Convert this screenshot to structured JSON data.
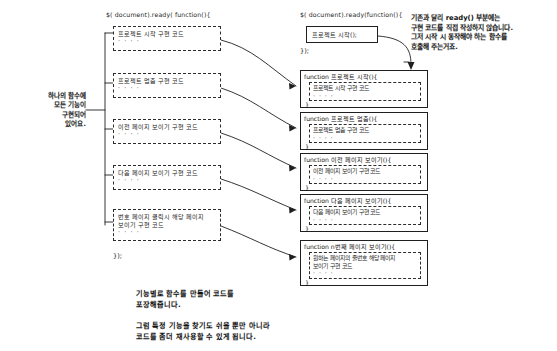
{
  "document": {
    "title": "jQuery ready() 함수 리팩토링 설명 다이어그램",
    "background_color": "#ffffff",
    "ink_color": "#1a1a1a"
  },
  "left_column": {
    "header": "$( document).ready( function(){",
    "footer": "});",
    "blocks": [
      {
        "line1": "프로젝트 시작 구현 코드",
        "line2": "",
        "dots": "· · · ·"
      },
      {
        "line1": "프로젝트 멈춤 구현 코드",
        "line2": "",
        "dots": "· · · ·"
      },
      {
        "line1": "이전 페이지 보이기 구현 코드",
        "line2": "",
        "dots": "· · · ·"
      },
      {
        "line1": "다음 페이지 보이기 구현 코드",
        "line2": "",
        "dots": "· · · ·"
      },
      {
        "line1": "번호 페이지 클릭시 해당 페이지",
        "line2": "보이기 구현 코드",
        "dots": "· · · ·"
      }
    ]
  },
  "right_column": {
    "header": "$( document).ready(function(){",
    "footer": "});",
    "ready_body": "프로젝트 시작();",
    "functions": [
      {
        "signature": "function 프로젝트 시작(){",
        "body_line1": "프로젝트 시작 구현 코드",
        "body_line2": "",
        "dots": "· · · ·",
        "close": "}"
      },
      {
        "signature": "function 프로젝트 멈춤(){",
        "body_line1": "프로젝트 멈춤 구현 코드",
        "body_line2": "",
        "dots": "· · · ·",
        "close": "}"
      },
      {
        "signature": "function 이전 페이지 보이기(){",
        "body_line1": "이전 페이지 보이기 구현 코드",
        "body_line2": "",
        "dots": "· · · ·",
        "close": "}"
      },
      {
        "signature": "function 다음 페이지 보이기(){",
        "body_line1": "다음 페이지 보이기 구현 코드",
        "body_line2": "",
        "dots": "· · · ·",
        "close": "}"
      },
      {
        "signature": "function n번째 페이지 보이기(){",
        "body_line1": "원하는 페이지의 줄번호 해당 페이지",
        "body_line2": "보이기 구현 코드",
        "dots": "· · · ·",
        "close": "}"
      }
    ]
  },
  "annotations": {
    "left_note": "하나의 함수에\n모든 기능이\n구현되어\n있어요.",
    "top_right_note": "기존과 달리 ready() 부분에는\n구현 코드를 직접 작성하지 않습니다.\n그저 시작 시 동작해야 하는 함수를\n호출해 주는거죠.",
    "bottom_note_1": "기능별로 함수를 만들어 코드를\n포장해줍니다.",
    "bottom_note_2": "그럼 특정 기능을 찾기도 쉬울 뿐만 아니라\n코드를 좀더 재사용할 수 있게 됩니다."
  }
}
